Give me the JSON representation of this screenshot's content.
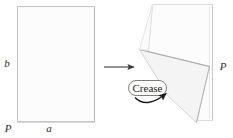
{
  "figure": {
    "caption_present": false,
    "background_color": "#ffffff",
    "stroke_color": "#b9b9b9",
    "dark_stroke_color": "#8a8a8a",
    "paper_fill": "#fbfbfb",
    "paper_fill_shaded": "#f4f4f4",
    "arrow_color": "#3a3a3a",
    "label_color": "#2b2b2b"
  },
  "left_panel": {
    "name": "unfolded-sheet",
    "shape": "rectangle",
    "labels": {
      "side_bottom": "a",
      "side_left": "b",
      "corner_bottom_left": "P"
    }
  },
  "transition": {
    "arrow_label": "",
    "direction": "right"
  },
  "right_panel": {
    "name": "folded-sheet",
    "labels": {
      "corner_right": "P"
    },
    "callout": {
      "label": "Crease",
      "pointer": "curved-arrow"
    }
  }
}
